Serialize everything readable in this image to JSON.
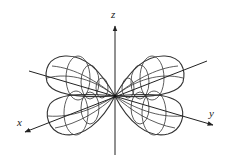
{
  "diagram": {
    "title": "",
    "type": "3d-lobe-pattern",
    "axes": {
      "x": {
        "label": "x"
      },
      "y": {
        "label": "y"
      },
      "z": {
        "label": "z"
      }
    },
    "lobes": [
      {
        "name": "left-upper"
      },
      {
        "name": "left-lower"
      },
      {
        "name": "right-upper"
      },
      {
        "name": "right-lower"
      }
    ],
    "colors": {
      "stroke": "#222222",
      "background": "#ffffff"
    }
  }
}
